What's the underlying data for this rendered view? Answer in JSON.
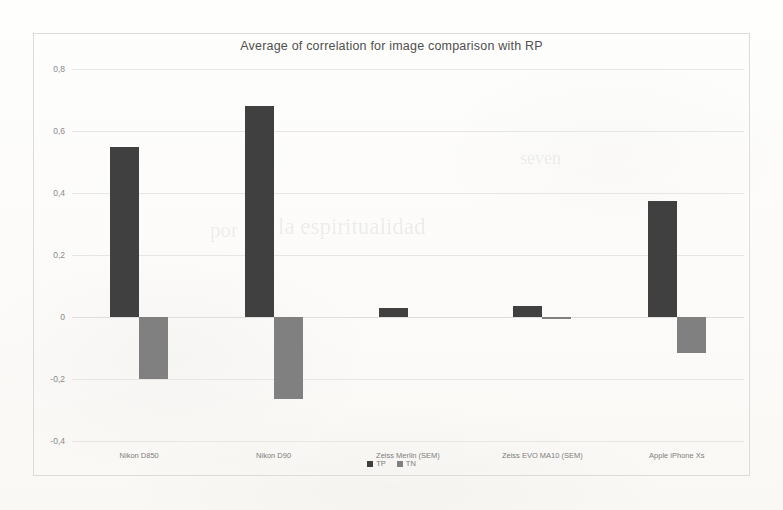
{
  "chart_data": {
    "type": "bar",
    "title": "Average of correlation for image comparison with RP",
    "xlabel": "",
    "ylabel": "",
    "ylim": [
      -0.4,
      0.8
    ],
    "grid": true,
    "legend_position": "bottom",
    "decimal_separator": ",",
    "categories": [
      "Nikon D850",
      "Nikon D90",
      "Zeiss Merlin (SEM)",
      "Zeiss EVO MA10 (SEM)",
      "Apple iPhone Xs"
    ],
    "yticks": [
      "0,8",
      "0,6",
      "0,4",
      "0,2",
      "0",
      "-0,2",
      "-0,4"
    ],
    "ytick_values": [
      0.8,
      0.6,
      0.4,
      0.2,
      0,
      -0.2,
      -0.4
    ],
    "series": [
      {
        "name": "TP",
        "color": "#404040",
        "values": [
          0.55,
          0.68,
          0.03,
          0.035,
          0.375
        ]
      },
      {
        "name": "TN",
        "color": "#808080",
        "values": [
          -0.2,
          -0.265,
          0,
          -0.005,
          -0.115
        ]
      }
    ]
  },
  "legend": {
    "items": [
      {
        "label": "TP",
        "color": "#404040"
      },
      {
        "label": "TN",
        "color": "#808080"
      }
    ]
  },
  "colors": {
    "tp": "#404040",
    "tn": "#808080",
    "grid": "#e6e6e4",
    "frame": "#dcdcda",
    "text": "#7d7d7d",
    "title": "#4f4f4f",
    "background": "#fdfdfb"
  }
}
